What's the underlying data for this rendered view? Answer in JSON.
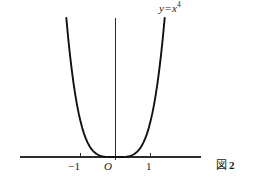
{
  "figure": {
    "caption_mark": "図",
    "caption_number": "2",
    "background_color": "#ffffff",
    "ink_color": "#111111",
    "axis_color": "#2b2b2b"
  },
  "labels": {
    "curve_label_var": "y",
    "curve_label_op": "=",
    "curve_label_base": "x",
    "curve_label_exponent": "4",
    "origin": "O",
    "tick_neg1": "−1",
    "tick_pos1": "1"
  },
  "chart_data": {
    "type": "line",
    "title": "",
    "subtitle": "",
    "xlabel": "",
    "ylabel": "",
    "annotations": [
      {
        "text": "y = x⁴",
        "x": 1.28,
        "y": 4.0,
        "role": "curve-label"
      },
      {
        "text": "O",
        "x": 0,
        "y": 0,
        "role": "origin-label"
      }
    ],
    "legend": [],
    "legend_position": "none",
    "grid": false,
    "equation": "y = x^4",
    "xlim": [
      -1.86,
      1.86
    ],
    "ylim": [
      0,
      4.0
    ],
    "xticks": [
      -1,
      1
    ],
    "xticklabels": [
      "−1",
      "1"
    ],
    "yticks": [],
    "yticklabels": [],
    "series": [
      {
        "name": "y = x^4",
        "x": [
          -1.405,
          -1.35,
          -1.3,
          -1.25,
          -1.2,
          -1.15,
          -1.1,
          -1.05,
          -1.0,
          -0.95,
          -0.9,
          -0.85,
          -0.8,
          -0.75,
          -0.7,
          -0.65,
          -0.6,
          -0.55,
          -0.5,
          -0.45,
          -0.4,
          -0.35,
          -0.3,
          -0.25,
          -0.2,
          -0.15,
          -0.1,
          -0.05,
          0.0,
          0.05,
          0.1,
          0.15,
          0.2,
          0.25,
          0.3,
          0.35,
          0.4,
          0.45,
          0.5,
          0.55,
          0.6,
          0.65,
          0.7,
          0.75,
          0.8,
          0.85,
          0.9,
          0.95,
          1.0,
          1.05,
          1.1,
          1.15,
          1.2,
          1.25,
          1.3,
          1.35,
          1.405
        ],
        "y": [
          3.897,
          3.32,
          2.856,
          2.441,
          2.074,
          1.749,
          1.464,
          1.216,
          1.0,
          0.815,
          0.656,
          0.522,
          0.41,
          0.316,
          0.24,
          0.179,
          0.13,
          0.092,
          0.063,
          0.041,
          0.026,
          0.015,
          0.008,
          0.004,
          0.002,
          0.001,
          0.0001,
          0.0,
          0.0,
          0.0,
          0.0001,
          0.001,
          0.002,
          0.004,
          0.008,
          0.015,
          0.026,
          0.041,
          0.063,
          0.092,
          0.13,
          0.179,
          0.24,
          0.316,
          0.41,
          0.522,
          0.656,
          0.815,
          1.0,
          1.216,
          1.464,
          1.749,
          2.074,
          2.441,
          2.856,
          3.32,
          3.897
        ]
      }
    ]
  }
}
